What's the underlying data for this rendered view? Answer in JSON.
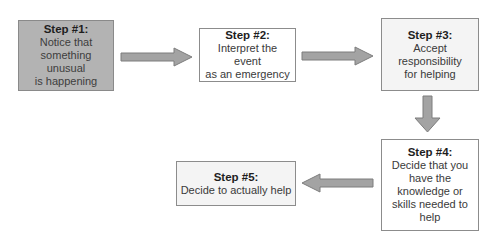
{
  "diagram": {
    "type": "flowchart",
    "steps": [
      {
        "id": 1,
        "title": "Step #1:",
        "body": "Notice that\nsomething unusual\nis happening",
        "fill": "#b3b3b3"
      },
      {
        "id": 2,
        "title": "Step #2:",
        "body": "Interpret the event\nas an emergency",
        "fill": "#ffffff"
      },
      {
        "id": 3,
        "title": "Step #3:",
        "body": "Accept\nresponsibility\nfor helping",
        "fill": "#f4f4f4"
      },
      {
        "id": 4,
        "title": "Step #4:",
        "body": "Decide that you\nhave the\nknowledge or\nskills needed to\nhelp",
        "fill": "#ffffff"
      },
      {
        "id": 5,
        "title": "Step #5:",
        "body": "Decide to actually help",
        "fill": "#f4f4f4"
      }
    ],
    "connections": [
      {
        "from": 1,
        "to": 2,
        "direction": "right"
      },
      {
        "from": 2,
        "to": 3,
        "direction": "right"
      },
      {
        "from": 3,
        "to": 4,
        "direction": "down"
      },
      {
        "from": 4,
        "to": 5,
        "direction": "left"
      }
    ],
    "colors": {
      "arrow_fill": "#a3a3a3",
      "arrow_stroke": "#7d7d7d",
      "border": "#8c8c8c"
    }
  }
}
